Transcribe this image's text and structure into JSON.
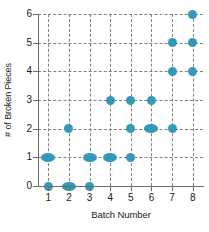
{
  "chart_data": {
    "type": "scatter",
    "title": "",
    "xlabel": "Batch Number",
    "ylabel": "# of Broken Pieces",
    "xlim": [
      0.5,
      8.5
    ],
    "ylim": [
      0,
      6
    ],
    "x_ticks": [
      "1",
      "2",
      "3",
      "4",
      "5",
      "6",
      "7",
      "8"
    ],
    "y_ticks": [
      "0",
      "1",
      "2",
      "3",
      "4",
      "5",
      "6"
    ],
    "grid": true,
    "grid_style": "dashed",
    "legend": "none",
    "marker_color": "#3399b8",
    "points": [
      {
        "x": 1,
        "y": 0,
        "count": 1
      },
      {
        "x": 2,
        "y": 0,
        "count": 2
      },
      {
        "x": 3,
        "y": 0,
        "count": 1
      },
      {
        "x": 1,
        "y": 1,
        "count": 2
      },
      {
        "x": 3,
        "y": 1,
        "count": 2
      },
      {
        "x": 4,
        "y": 1,
        "count": 2
      },
      {
        "x": 5,
        "y": 1,
        "count": 1
      },
      {
        "x": 2,
        "y": 2,
        "count": 1
      },
      {
        "x": 5,
        "y": 2,
        "count": 1
      },
      {
        "x": 6,
        "y": 2,
        "count": 2
      },
      {
        "x": 7,
        "y": 2,
        "count": 1
      },
      {
        "x": 4,
        "y": 3,
        "count": 1
      },
      {
        "x": 5,
        "y": 3,
        "count": 1
      },
      {
        "x": 6,
        "y": 3,
        "count": 1
      },
      {
        "x": 7,
        "y": 4,
        "count": 1
      },
      {
        "x": 8,
        "y": 4,
        "count": 1
      },
      {
        "x": 7,
        "y": 5,
        "count": 1
      },
      {
        "x": 8,
        "y": 5,
        "count": 1
      },
      {
        "x": 8,
        "y": 6,
        "count": 1
      }
    ]
  }
}
